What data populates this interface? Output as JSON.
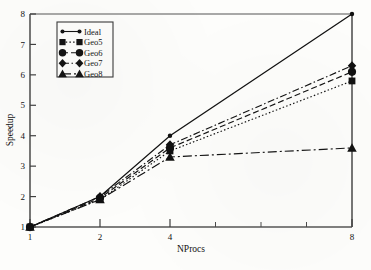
{
  "chart_data": {
    "type": "line",
    "title": "",
    "xlabel": "NProcs",
    "ylabel": "Speedup",
    "x": [
      1,
      2,
      4,
      8
    ],
    "xtick_labels": [
      "1",
      "2",
      "4",
      "8"
    ],
    "ytick_labels": [
      "1",
      "2",
      "3",
      "4",
      "5",
      "6",
      "7",
      "8"
    ],
    "ylim": [
      1,
      8
    ],
    "xlim": [
      1,
      8
    ],
    "xscale": "log2-like (1,2,4,8 unevenly spaced)",
    "grid": false,
    "legend_position": "upper left inside axes",
    "series": [
      {
        "name": "Ideal",
        "marker": "circle-small",
        "dash": "solid",
        "values": [
          1,
          2.0,
          4.0,
          8.0
        ]
      },
      {
        "name": "Geo5",
        "marker": "square",
        "dash": "dotted",
        "values": [
          1,
          1.9,
          3.5,
          5.8
        ]
      },
      {
        "name": "Geo6",
        "marker": "circle",
        "dash": "dashed",
        "values": [
          1,
          1.95,
          3.6,
          6.1
        ]
      },
      {
        "name": "Geo7",
        "marker": "diamond",
        "dash": "dashdot",
        "values": [
          1,
          2.0,
          3.7,
          6.3
        ]
      },
      {
        "name": "Geo8",
        "marker": "triangle",
        "dash": "dashdotlong",
        "values": [
          1,
          1.9,
          3.3,
          3.6
        ]
      }
    ],
    "legend_entries": [
      "Ideal",
      "Geo5",
      "Geo6",
      "Geo7",
      "Geo8"
    ],
    "colors": {
      "line": "#111111",
      "axis": "#4a4a4a",
      "background": "#fdfdfb"
    }
  }
}
